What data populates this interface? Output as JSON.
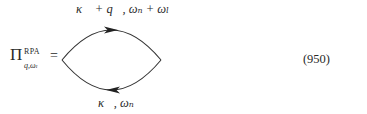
{
  "equation": {
    "lhs": {
      "symbol": "Π",
      "superscript": "RPA",
      "subscript": "q,ωₗ",
      "equals": "="
    },
    "diagram": {
      "type": "bubble-loop",
      "top_propagator": {
        "label": "κ⃗ + q⃗, ωₙ + ωₗ",
        "arrow_direction": "right"
      },
      "bottom_propagator": {
        "label": "κ⃗, ωₙ",
        "arrow_direction": "left"
      },
      "line_color": "#333333"
    },
    "number": "(950)"
  }
}
